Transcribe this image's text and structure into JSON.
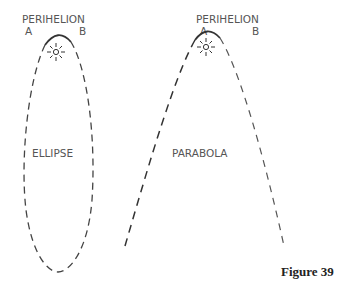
{
  "figure": {
    "caption": "Figure 39"
  },
  "ellipse_panel": {
    "perihelion_label": "PERIHELION",
    "point_a_label": "A",
    "point_b_label": "B",
    "shape_label": "ELLIPSE",
    "sun_icon": "sun-icon"
  },
  "parabola_panel": {
    "perihelion_label": "PERIHELION",
    "point_a_label": "A",
    "point_b_label": "B",
    "shape_label": "PARABOLA",
    "sun_icon": "sun-icon"
  },
  "colors": {
    "line": "#333333",
    "text": "#555555",
    "caption": "#222222"
  }
}
